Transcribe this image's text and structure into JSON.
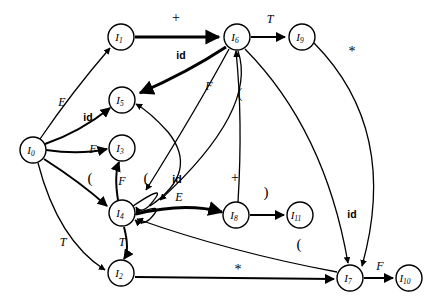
{
  "diagram": {
    "type": "directed-graph",
    "background_color": "#ffffff",
    "stroke_color": "#000000",
    "nodes": [
      {
        "id": "I0",
        "label": "I",
        "sub": "0",
        "x": 33,
        "y": 150,
        "r": 13
      },
      {
        "id": "I1",
        "label": "I",
        "sub": "1",
        "x": 121,
        "y": 37,
        "r": 13
      },
      {
        "id": "I2",
        "label": "I",
        "sub": "2",
        "x": 121,
        "y": 273,
        "r": 13
      },
      {
        "id": "I3",
        "label": "I",
        "sub": "3",
        "x": 122,
        "y": 148,
        "r": 13
      },
      {
        "id": "I4",
        "label": "I",
        "sub": "4",
        "x": 122,
        "y": 213,
        "r": 13
      },
      {
        "id": "I5",
        "label": "I",
        "sub": "5",
        "x": 122,
        "y": 100,
        "r": 13
      },
      {
        "id": "I6",
        "label": "I",
        "sub": "6",
        "x": 237,
        "y": 37,
        "r": 13
      },
      {
        "id": "I7",
        "label": "I",
        "sub": "7",
        "x": 350,
        "y": 278,
        "r": 13
      },
      {
        "id": "I8",
        "label": "I",
        "sub": "8",
        "x": 236,
        "y": 215,
        "r": 13
      },
      {
        "id": "I9",
        "label": "I",
        "sub": "9",
        "x": 302,
        "y": 37,
        "r": 13
      },
      {
        "id": "I10",
        "label": "I",
        "sub": "10",
        "x": 409,
        "y": 278,
        "r": 13
      },
      {
        "id": "I11",
        "label": "I",
        "sub": "11",
        "x": 300,
        "y": 215,
        "r": 13
      }
    ],
    "edges": [
      {
        "id": "e-I1-I6",
        "from": "I1",
        "to": "I6",
        "label": "+",
        "label_style": "sym",
        "label_x": 176,
        "label_y": 19
      },
      {
        "id": "e-I6-I9",
        "from": "I6",
        "to": "I9",
        "label": "T",
        "label_style": "ital",
        "label_x": 270,
        "label_y": 20
      },
      {
        "id": "e-I6-I5",
        "from": "I6",
        "to": "I5",
        "label": "id",
        "label_style": "bold",
        "label_x": 181,
        "label_y": 56
      },
      {
        "id": "e-I6-I4a",
        "from": "I6",
        "to": "I4",
        "label": "F",
        "label_style": "ital",
        "label_x": 209,
        "label_y": 87
      },
      {
        "id": "e-I6-I4b",
        "from": "I6",
        "to": "I4",
        "label": "(",
        "label_style": "paren",
        "label_x": 240,
        "label_y": 95
      },
      {
        "id": "e-I0-I1",
        "from": "I0",
        "to": "I1",
        "label": "E",
        "label_style": "ital",
        "label_x": 62,
        "label_y": 103
      },
      {
        "id": "e-I0-I5",
        "from": "I0",
        "to": "I5",
        "label": "id",
        "label_style": "bold",
        "label_x": 88,
        "label_y": 118
      },
      {
        "id": "e-I0-I3",
        "from": "I0",
        "to": "I3",
        "label": "F",
        "label_style": "ital",
        "label_x": 93,
        "label_y": 150
      },
      {
        "id": "e-I0-I4",
        "from": "I0",
        "to": "I4",
        "label": "(",
        "label_style": "paren",
        "label_x": 90,
        "label_y": 180
      },
      {
        "id": "e-I0-I2",
        "from": "I0",
        "to": "I2",
        "label": "T",
        "label_style": "ital",
        "label_x": 63,
        "label_y": 243
      },
      {
        "id": "e-I4-I3",
        "from": "I4",
        "to": "I3",
        "label": "F",
        "label_style": "ital",
        "label_x": 122,
        "label_y": 182
      },
      {
        "id": "e-I4-I4",
        "from": "I4",
        "to": "I4",
        "label": "(",
        "label_style": "paren",
        "label_x": 146,
        "label_y": 180
      },
      {
        "id": "e-I4-I5",
        "from": "I4",
        "to": "I5",
        "label": "id",
        "label_style": "bold",
        "label_x": 177,
        "label_y": 180
      },
      {
        "id": "e-I4-I8",
        "from": "I4",
        "to": "I8",
        "label": "E",
        "label_style": "ital",
        "label_x": 179,
        "label_y": 198
      },
      {
        "id": "e-I4-I2",
        "from": "I4",
        "to": "I2",
        "label": "T",
        "label_style": "ital",
        "label_x": 122,
        "label_y": 243
      },
      {
        "id": "e-I8-I6",
        "from": "I8",
        "to": "I6",
        "label": "+",
        "label_style": "sym",
        "label_x": 235,
        "label_y": 179
      },
      {
        "id": "e-I8-I11",
        "from": "I8",
        "to": "I11",
        "label": ")",
        "label_style": "paren",
        "label_x": 266,
        "label_y": 194
      },
      {
        "id": "e-I9-I7",
        "from": "I9",
        "to": "I7",
        "label": "*",
        "label_style": "sym",
        "label_x": 352,
        "label_y": 53
      },
      {
        "id": "e-I6-I7",
        "from": "I6",
        "to": "I7",
        "label": "id",
        "label_style": "bold",
        "label_x": 352,
        "label_y": 215
      },
      {
        "id": "e-I7-I4",
        "from": "I7",
        "to": "I4",
        "label": "(",
        "label_style": "paren",
        "label_x": 299,
        "label_y": 246
      },
      {
        "id": "e-I2-I7",
        "from": "I2",
        "to": "I7",
        "label": "*",
        "label_style": "sym",
        "label_x": 238,
        "label_y": 271
      },
      {
        "id": "e-I7-I10",
        "from": "I7",
        "to": "I10",
        "label": "F",
        "label_style": "ital",
        "label_x": 380,
        "label_y": 267
      }
    ]
  }
}
